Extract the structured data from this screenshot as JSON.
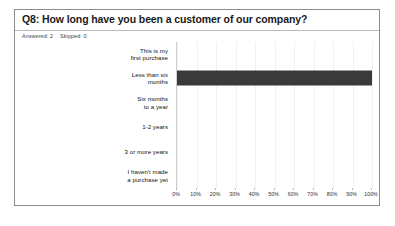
{
  "card": {
    "title": "Q8: How long have you been a customer of our company?",
    "meta": {
      "answered_label": "Answered:",
      "answered_value": "2",
      "skipped_label": "Skipped:",
      "skipped_value": "0"
    }
  },
  "chart_data": {
    "type": "bar",
    "orientation": "horizontal",
    "title": "Q8: How long have you been a customer of our company?",
    "categories": [
      "This is my first purchase",
      "Less than six months",
      "Six months to a year",
      "1-2 years",
      "3 or more years",
      "I haven't made a purchase yet"
    ],
    "category_lines": [
      [
        "This is my",
        "first purchase"
      ],
      [
        "Less than six",
        "months"
      ],
      [
        "Six months",
        "to a year"
      ],
      [
        "1-2 years"
      ],
      [
        "3 or more years"
      ],
      [
        "I haven't made",
        "a purchase yet"
      ]
    ],
    "values": [
      0,
      100,
      0,
      0,
      0,
      0
    ],
    "xlabel": "",
    "ylabel": "",
    "xlim": [
      0,
      100
    ],
    "tick_labels": [
      "0%",
      "10%",
      "20%",
      "30%",
      "40%",
      "50%",
      "60%",
      "70%",
      "80%",
      "90%",
      "100%"
    ],
    "tick_values": [
      0,
      10,
      20,
      30,
      40,
      50,
      60,
      70,
      80,
      90,
      100
    ],
    "grid": true,
    "legend": "none",
    "bar_color": "#3a3a3a"
  }
}
